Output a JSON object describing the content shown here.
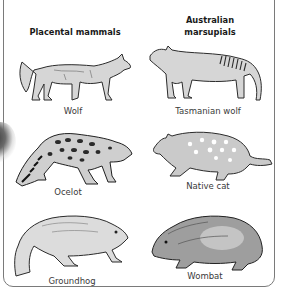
{
  "headings": {
    "placental": "Placental mammals",
    "marsupial_line1": "Australian",
    "marsupial_line2": "marsupials"
  },
  "pairs": [
    {
      "placental": {
        "name": "Wolf",
        "icon": "wolf-illustration"
      },
      "marsupial": {
        "name": "Tasmanian wolf",
        "icon": "tasmanian-wolf-illustration"
      }
    },
    {
      "placental": {
        "name": "Ocelot",
        "icon": "ocelot-illustration"
      },
      "marsupial": {
        "name": "Native cat",
        "icon": "native-cat-illustration"
      }
    },
    {
      "placental": {
        "name": "Groundhog",
        "icon": "groundhog-illustration"
      },
      "marsupial": {
        "name": "Wombat",
        "icon": "wombat-illustration"
      }
    }
  ],
  "colors": {
    "frame": "#7a7a7a",
    "heading": "#1a1a1a",
    "label": "#3a3a3a",
    "ink": "#2b2b2b",
    "fill": "#d4d4d4"
  }
}
